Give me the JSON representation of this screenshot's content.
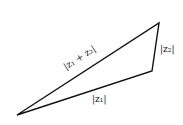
{
  "diagram": {
    "labels": {
      "hyp": "|z₁ + z₂|",
      "side1": "|z₁|",
      "side2": "|z₂|"
    },
    "vertices": {
      "origin": [
        17,
        115
      ],
      "z1": [
        152,
        71
      ],
      "sum": [
        159,
        23
      ]
    }
  }
}
